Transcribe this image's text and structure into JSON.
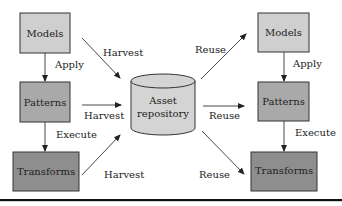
{
  "diagram": {
    "left": {
      "models": "Models",
      "patterns": "Patterns",
      "transforms": "Transforms",
      "apply": "Apply",
      "execute": "Execute"
    },
    "right": {
      "models": "Models",
      "patterns": "Patterns",
      "transforms": "Transforms",
      "apply": "Apply",
      "execute": "Execute"
    },
    "repository": {
      "line1": "Asset",
      "line2": "repository"
    },
    "edges": {
      "harvest_top": "Harvest",
      "harvest_mid": "Harvest",
      "harvest_bottom": "Harvest",
      "reuse_top": "Reuse",
      "reuse_mid": "Reuse",
      "reuse_bottom": "Reuse"
    },
    "colors": {
      "models_fill": "#cfcfcf",
      "patterns_fill": "#a9a9a9",
      "transforms_fill": "#8e8e8e",
      "repository_fill": "#d4d4d4",
      "stroke": "#333333"
    }
  }
}
